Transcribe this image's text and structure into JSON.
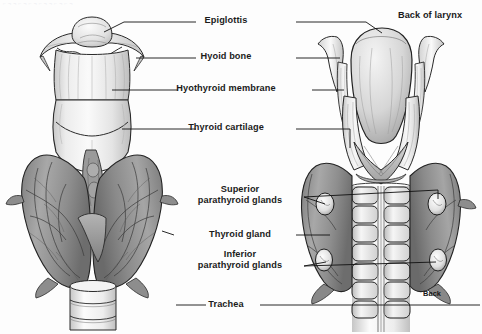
{
  "figure": {
    "background_color": "#fdfdfd",
    "ink_color": "#1b1b1b",
    "views": [
      {
        "name": "anterior-view",
        "caption": "Front view of larynx and thyroid gland"
      },
      {
        "name": "posterior-view",
        "caption": "Back view of larynx and thyroid gland"
      }
    ]
  },
  "labels": {
    "epiglottis": "Epiglottis",
    "hyoid_bone": "Hyoid bone",
    "hyothyroid_membrane": "Hyothyroid membrane",
    "thyroid_cartilage": "Thyroid cartilage",
    "superior_parathyroid_glands": "Superior\nparathyroid glands",
    "thyroid_gland": "Thyroid gland",
    "inferior_parathyroid_glands": "Inferior\nparathyroid glands",
    "trachea": "Trachea",
    "back_of_larynx": "Back of larynx",
    "back_marker": "Back"
  },
  "structures": {
    "anterior": [
      "epiglottis",
      "hyoid bone",
      "hyothyroid membrane",
      "thyroid cartilage",
      "thyroid gland",
      "trachea"
    ],
    "posterior": [
      "epiglottis",
      "hyoid bone",
      "hyothyroid membrane",
      "thyroid cartilage",
      "superior parathyroid glands",
      "thyroid gland",
      "inferior parathyroid glands",
      "trachea"
    ]
  },
  "leader_lines": {
    "count": 15,
    "color": "#111111",
    "width_px": 0.9
  }
}
